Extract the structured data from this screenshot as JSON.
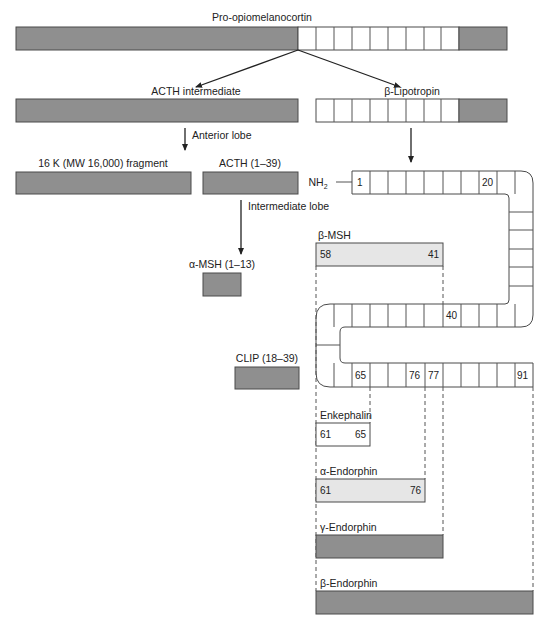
{
  "title": "Pro-opiomelanocortin",
  "colors": {
    "precursor_segment": "#8f8f8f",
    "peptide_highlight": "#e6e6e6",
    "cell": "#ffffff",
    "outline": "#4a4a4a"
  },
  "branches": {
    "left": "ACTH intermediate",
    "right": "β-Lipotropin"
  },
  "steps": {
    "anterior_lobe": "Anterior lobe",
    "intermediate_lobe": "Intermediate lobe"
  },
  "products": {
    "fragment_16k": "16 K (MW 16,000) fragment",
    "acth": "ACTH (1–39)",
    "alpha_msh": "α-MSH (1–13)",
    "clip": "CLIP (18–39)"
  },
  "lipotropin_chain": {
    "n_terminus": "NH2",
    "n_terminus_main": "NH",
    "n_terminus_sub": "2",
    "labels": {
      "r1_start": "1",
      "r1_20": "20",
      "r2_40": "40",
      "r3_65": "65",
      "r3_76": "76",
      "r3_77": "77",
      "r3_91": "91"
    }
  },
  "peptides": {
    "beta_msh": {
      "name": "β-MSH",
      "start": "58",
      "end": "41"
    },
    "enkephalin": {
      "name": "Enkephalin",
      "start": "61",
      "end": "65"
    },
    "alpha_endorphin": {
      "name": "α-Endorphin",
      "start": "61",
      "end": "76"
    },
    "gamma_endorphin": {
      "name": "γ-Endorphin"
    },
    "beta_endorphin": {
      "name": "β-Endorphin"
    }
  }
}
